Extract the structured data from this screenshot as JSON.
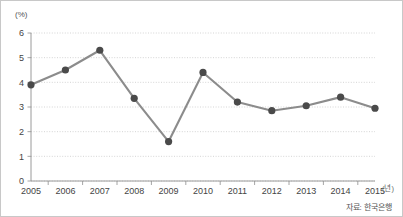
{
  "chart_data": {
    "type": "line",
    "title": "",
    "subtitle": "",
    "xlabel": "",
    "ylabel": "",
    "y_unit_label": "(%)",
    "x_unit_label": "(년)",
    "categories": [
      "2005",
      "2006",
      "2007",
      "2008",
      "2009",
      "2010",
      "2011",
      "2012",
      "2013",
      "2014",
      "2015"
    ],
    "values": [
      3.9,
      4.5,
      5.3,
      3.35,
      1.6,
      4.4,
      3.2,
      2.85,
      3.05,
      3.4,
      2.95
    ],
    "series": [
      {
        "name": "",
        "values": [
          3.9,
          4.5,
          5.3,
          3.35,
          1.6,
          4.4,
          3.2,
          2.85,
          3.05,
          3.4,
          2.95
        ]
      }
    ],
    "ylim": [
      0,
      6
    ],
    "xlim": [
      "2005",
      "2015"
    ],
    "y_ticks": [
      "0",
      "1",
      "2",
      "3",
      "4",
      "5",
      "6"
    ],
    "x_ticks": [
      "2005",
      "2006",
      "2007",
      "2008",
      "2009",
      "2010",
      "2011",
      "2012",
      "2013",
      "2014",
      "2015"
    ],
    "grid": true,
    "grid_axis": "y",
    "legend": false,
    "legend_position": "none",
    "marker": "circle",
    "source_note": "자료: 한국은행",
    "colors": {
      "line": "#8c8c8c",
      "marker": "#4a4a4a",
      "grid": "#b9b9b9",
      "axis": "#8e8e8e",
      "text": "#444444",
      "background": "#ffffff"
    }
  }
}
